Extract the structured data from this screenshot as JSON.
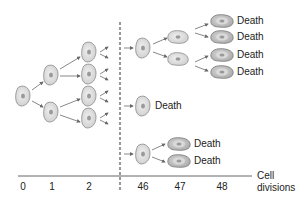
{
  "diagram": {
    "topic": "Cell division limit (senescence)",
    "death_label": "Death",
    "axis": {
      "title_line1": "Cell",
      "title_line2": "divisions",
      "ticks": [
        "0",
        "1",
        "2",
        "46",
        "47",
        "48"
      ]
    },
    "colors": {
      "cell_fill": "#e2e2e2",
      "cell_stroke": "#8a8a8a",
      "dying_cell_fill": "#bdbdbd",
      "nucleus": "#9a9a9a",
      "arrow": "#6a6a6a",
      "axis": "#555555",
      "break_line": "#333333"
    },
    "death_labels": [
      {
        "text": "Death"
      },
      {
        "text": "Death"
      },
      {
        "text": "Death"
      },
      {
        "text": "Death"
      },
      {
        "text": "Death"
      },
      {
        "text": "Death"
      },
      {
        "text": "Death"
      }
    ]
  }
}
